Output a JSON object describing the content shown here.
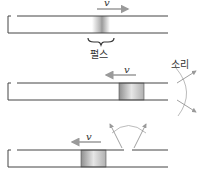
{
  "diagram": {
    "type": "sound-pulse-in-tube",
    "panels": [
      {
        "id": "top",
        "velocity_label": "v",
        "velocity_direction": "right",
        "pulse_label": "펄스"
      },
      {
        "id": "middle",
        "velocity_label": "v",
        "velocity_direction": "left",
        "sound_label": "소리"
      },
      {
        "id": "bottom",
        "velocity_label": "v",
        "velocity_direction": "left"
      }
    ]
  },
  "colors": {
    "line": "#444444",
    "arrow": "#9a9a9a",
    "pulse_dark": "#8c8c8c",
    "pulse_light": "#f2f2f2"
  }
}
